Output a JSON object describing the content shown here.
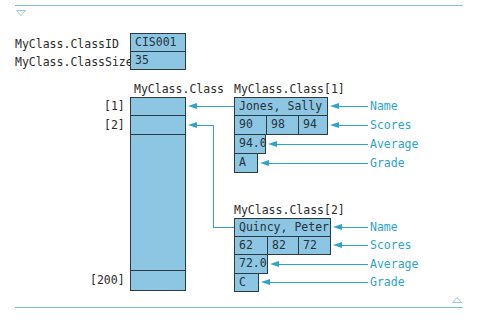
{
  "scalars": {
    "class_id": {
      "label": "MyClass.ClassID",
      "value": "CIS001"
    },
    "class_size": {
      "label": "MyClass.ClassSize",
      "value": "35"
    }
  },
  "array": {
    "title": "MyClass.Class",
    "indices": [
      "[1]",
      "[2]",
      "[200]"
    ]
  },
  "records": [
    {
      "title": "MyClass.Class[1]",
      "name": "Jones, Sally",
      "scores": [
        "90",
        "98",
        "94"
      ],
      "average": "94.0",
      "grade": "A"
    },
    {
      "title": "MyClass.Class[2]",
      "name": "Quincy, Peter",
      "scores": [
        "62",
        "82",
        "72"
      ],
      "average": "72.0",
      "grade": "C"
    }
  ],
  "field_labels": {
    "name": "Name",
    "scores": "Scores",
    "average": "Average",
    "grade": "Grade"
  },
  "colors": {
    "cell_fill": "#8dc6e3",
    "cell_border": "#2c3a42",
    "arrow": "#2fa3c8",
    "rule": "#7fc0d2"
  },
  "icons": {
    "top": "triangle-down-icon",
    "bottom": "triangle-up-icon"
  }
}
